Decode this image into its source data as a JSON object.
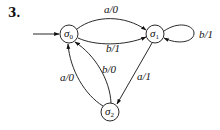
{
  "problem_number": "3.",
  "states": [
    {
      "id": "s0",
      "name": "σ",
      "subscript": "0",
      "initial": true
    },
    {
      "id": "s1",
      "name": "σ",
      "subscript": "1",
      "initial": false
    },
    {
      "id": "s2",
      "name": "σ",
      "subscript": "2",
      "initial": false
    }
  ],
  "transitions": [
    {
      "from": "s0",
      "to": "s1",
      "label": "a/0"
    },
    {
      "from": "s0",
      "to": "s1",
      "label": "b/1"
    },
    {
      "from": "s1",
      "to": "s1",
      "label": "b/1"
    },
    {
      "from": "s1",
      "to": "s2",
      "label": "a/1"
    },
    {
      "from": "s2",
      "to": "s0",
      "label": "a/0"
    },
    {
      "from": "s2",
      "to": "s0",
      "label": "b/0"
    }
  ],
  "colors": {
    "stroke": "#111111",
    "background": "#ffffff"
  }
}
